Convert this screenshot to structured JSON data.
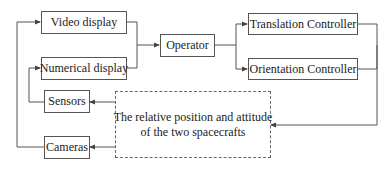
{
  "diagram": {
    "type": "block-diagram",
    "nodes": {
      "video_display": "Video display",
      "numerical_display": "Numerical display",
      "operator": "Operator",
      "translation_controller": "Translation Controller",
      "orientation_controller": "Orientation Controller",
      "sensors": "Sensors",
      "cameras": "Cameras",
      "environment_line1": "The relative position and attitude",
      "environment_line2": "of the two spacecrafts"
    },
    "edges": [
      {
        "from": "Video display",
        "to": "Operator"
      },
      {
        "from": "Numerical display",
        "to": "Operator"
      },
      {
        "from": "Operator",
        "to": "Translation Controller"
      },
      {
        "from": "Operator",
        "to": "Orientation Controller"
      },
      {
        "from": "Translation Controller",
        "to": "The relative position and attitude of the two spacecrafts"
      },
      {
        "from": "Orientation Controller",
        "to": "The relative position and attitude of the two spacecrafts"
      },
      {
        "from": "The relative position and attitude of the two spacecrafts",
        "to": "Sensors"
      },
      {
        "from": "The relative position and attitude of the two spacecrafts",
        "to": "Cameras"
      },
      {
        "from": "Sensors",
        "to": "Numerical display"
      },
      {
        "from": "Cameras",
        "to": "Video display"
      }
    ],
    "colors": {
      "line": "#555555",
      "background": "#ffffff",
      "text": "#222222"
    }
  }
}
